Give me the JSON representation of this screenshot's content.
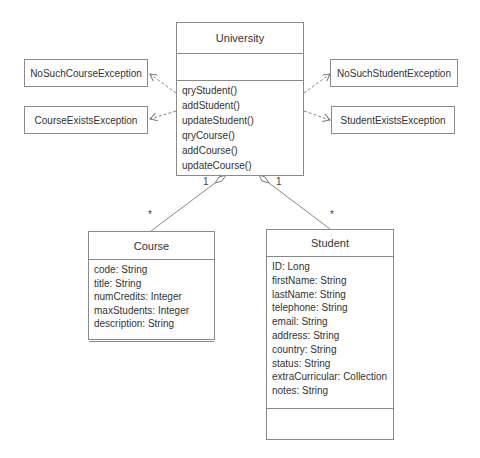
{
  "diagram": {
    "type": "UML class diagram",
    "classes": {
      "university": {
        "name": "University",
        "attributes": [],
        "operations": [
          "qryStudent()",
          "addStudent()",
          "updateStudent()",
          "qryCourse()",
          "addCourse()",
          "updateCourse()"
        ]
      },
      "course": {
        "name": "Course",
        "attributes": [
          "code: String",
          "title: String",
          "numCredits: Integer",
          "maxStudents: Integer",
          "description: String"
        ],
        "operations": []
      },
      "student": {
        "name": "Student",
        "attributes": [
          "ID: Long",
          "firstName: String",
          "lastName: String",
          "telephone: String",
          "email: String",
          "address: String",
          "country: String",
          "status: String",
          "extraCurricular: Collection",
          "notes: String"
        ],
        "operations": []
      }
    },
    "exceptions": {
      "no_such_course": "NoSuchCourseException",
      "course_exists": "CourseExistsException",
      "no_such_student": "NoSuchStudentException",
      "student_exists": "StudentExistsException"
    },
    "associations": {
      "university_course": {
        "type": "aggregation",
        "source_multiplicity": "1",
        "target_multiplicity": "*"
      },
      "university_student": {
        "type": "aggregation",
        "source_multiplicity": "1",
        "target_multiplicity": "*"
      }
    },
    "dependencies": [
      {
        "from": "University",
        "to": "NoSuchCourseException",
        "style": "dashed"
      },
      {
        "from": "University",
        "to": "CourseExistsException",
        "style": "dashed"
      },
      {
        "from": "University",
        "to": "NoSuchStudentException",
        "style": "dashed"
      },
      {
        "from": "University",
        "to": "StudentExistsException",
        "style": "dashed"
      }
    ]
  }
}
